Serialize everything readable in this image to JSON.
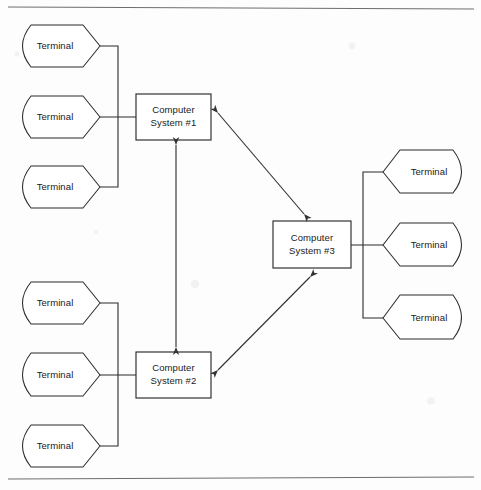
{
  "diagram": {
    "type": "network-topology",
    "background_color": "#fdfdfd",
    "line_color": "#2b2b2b",
    "rule_color": "#6e6e6e",
    "rules": [
      {
        "name": "top-rule",
        "y": 7
      },
      {
        "name": "bottom-rule",
        "y": 478
      }
    ],
    "systems": [
      {
        "id": "cs1",
        "label_line1": "Computer",
        "label_line2": "System #1",
        "x": 136,
        "y": 94,
        "width": 75,
        "height": 46
      },
      {
        "id": "cs2",
        "label_line1": "Computer",
        "label_line2": "System #2",
        "x": 136,
        "y": 352,
        "width": 75,
        "height": 46
      },
      {
        "id": "cs3",
        "label_line1": "Computer",
        "label_line2": "System #3",
        "x": 273,
        "y": 221,
        "width": 78,
        "height": 47
      }
    ],
    "terminal_groups": [
      {
        "id": "group-cs1",
        "attached_to": "cs1",
        "orientation": "left",
        "bus_x": 118,
        "bus_top": 46,
        "bus_bottom": 187,
        "terminals": [
          {
            "id": "t1",
            "label": "Terminal",
            "x": 14,
            "y": 25,
            "width": 86,
            "height": 42
          },
          {
            "id": "t2",
            "label": "Terminal",
            "x": 14,
            "y": 96,
            "width": 86,
            "height": 42
          },
          {
            "id": "t3",
            "label": "Terminal",
            "x": 14,
            "y": 166,
            "width": 86,
            "height": 42
          }
        ]
      },
      {
        "id": "group-cs2",
        "attached_to": "cs2",
        "orientation": "left",
        "bus_x": 118,
        "bus_top": 303,
        "bus_bottom": 446,
        "terminals": [
          {
            "id": "t4",
            "label": "Terminal",
            "x": 14,
            "y": 282,
            "width": 86,
            "height": 42
          },
          {
            "id": "t5",
            "label": "Terminal",
            "x": 14,
            "y": 353,
            "width": 86,
            "height": 42
          },
          {
            "id": "t6",
            "label": "Terminal",
            "x": 14,
            "y": 425,
            "width": 86,
            "height": 42
          }
        ]
      },
      {
        "id": "group-cs3",
        "attached_to": "cs3",
        "orientation": "right",
        "bus_x": 363,
        "bus_top": 172,
        "bus_bottom": 318,
        "terminals": [
          {
            "id": "t7",
            "label": "Terminal",
            "x": 383,
            "y": 150,
            "width": 87,
            "height": 43
          },
          {
            "id": "t8",
            "label": "Terminal",
            "x": 383,
            "y": 223,
            "width": 87,
            "height": 43
          },
          {
            "id": "t9",
            "label": "Terminal",
            "x": 383,
            "y": 295,
            "width": 87,
            "height": 43
          }
        ]
      }
    ],
    "links": [
      {
        "id": "link-cs1-cs2",
        "from": "cs1",
        "to": "cs2",
        "style": "double-arrow",
        "x1": 176,
        "y1": 145,
        "x2": 176,
        "y2": 347
      },
      {
        "id": "link-cs1-cs3",
        "from": "cs1",
        "to": "cs3",
        "style": "double-arrow",
        "x1": 218,
        "y1": 113,
        "x2": 304,
        "y2": 214
      },
      {
        "id": "link-cs2-cs3",
        "from": "cs2",
        "to": "cs3",
        "style": "double-arrow",
        "x1": 218,
        "y1": 370,
        "x2": 310,
        "y2": 277
      }
    ]
  }
}
